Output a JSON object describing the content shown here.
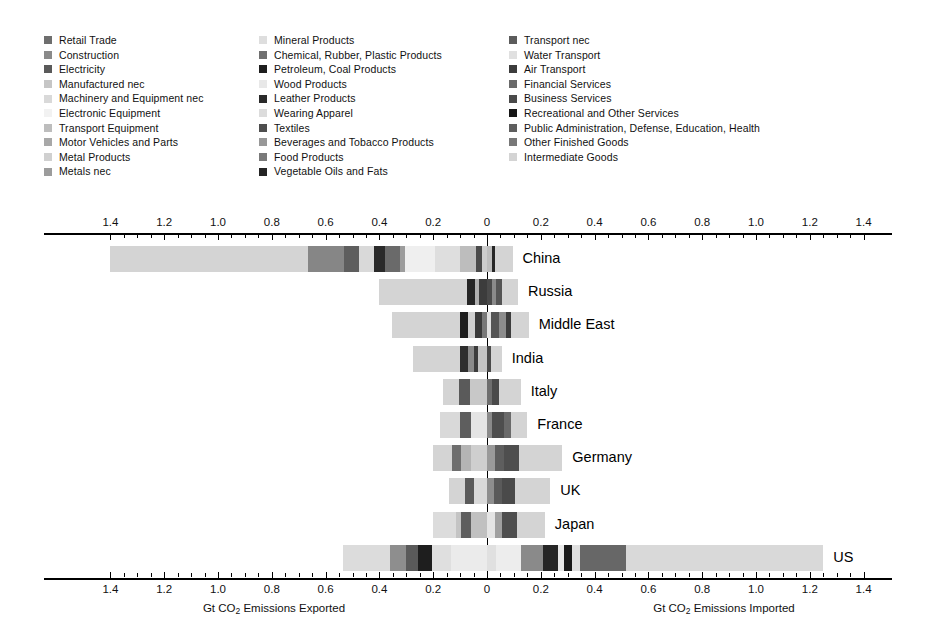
{
  "chart_data": {
    "type": "bar",
    "orientation": "horizontal-diverging-stacked",
    "title": "",
    "xlabel_left": "Gt CO2 Emissions Exported",
    "xlabel_right": "Gt CO2 Emissions Imported",
    "ylabel": "",
    "axis": {
      "left_max": 1.4,
      "right_max": 1.4,
      "center": 0,
      "major_ticks_left": [
        1.4,
        1.2,
        1.0,
        0.8,
        0.6,
        0.4,
        0.2,
        0
      ],
      "major_ticks_right": [
        0.2,
        0.4,
        0.6,
        0.8,
        1.0,
        1.2,
        1.4
      ],
      "minor_tick_step": 0.05,
      "tick_labels_left": [
        "1.4",
        "1.2",
        "1.0",
        "0.8",
        "0.6",
        "0.4",
        "0.2",
        "0"
      ],
      "tick_labels_right": [
        "0.2",
        "0.4",
        "0.6",
        "0.8",
        "1.0",
        "1.2",
        "1.4"
      ],
      "grid": false,
      "axis_top": true,
      "axis_bottom": true
    },
    "legend": {
      "position": "top",
      "columns": 3,
      "entries": [
        {
          "label": "Retail Trade",
          "color": "#6e6e6e"
        },
        {
          "label": "Construction",
          "color": "#8a8a8a"
        },
        {
          "label": "Electricity",
          "color": "#5a5a5a"
        },
        {
          "label": "Manufactured nec",
          "color": "#c6c6c6"
        },
        {
          "label": "Machinery and Equipment nec",
          "color": "#d9d9d9"
        },
        {
          "label": "Electronic Equipment",
          "color": "#f2f2f2"
        },
        {
          "label": "Transport Equipment",
          "color": "#bdbdbd"
        },
        {
          "label": "Motor Vehicles and Parts",
          "color": "#a8a8a8"
        },
        {
          "label": "Metal Products",
          "color": "#d0d0d0"
        },
        {
          "label": "Metals nec",
          "color": "#9c9c9c"
        },
        {
          "label": "Mineral Products",
          "color": "#dedede"
        },
        {
          "label": "Chemical, Rubber, Plastic Products",
          "color": "#707070"
        },
        {
          "label": "Petroleum, Coal Products",
          "color": "#1e1e1e"
        },
        {
          "label": "Wood Products",
          "color": "#e8e8e8"
        },
        {
          "label": "Leather Products",
          "color": "#2a2a2a"
        },
        {
          "label": "Wearing Apparel",
          "color": "#dcdcdc"
        },
        {
          "label": "Textiles",
          "color": "#4e4e4e"
        },
        {
          "label": "Beverages and Tobacco Products",
          "color": "#989898"
        },
        {
          "label": "Food Products",
          "color": "#7a7a7a"
        },
        {
          "label": "Vegetable Oils and Fats",
          "color": "#242424"
        },
        {
          "label": "Transport nec",
          "color": "#5c5c5c"
        },
        {
          "label": "Water Transport",
          "color": "#e0e0e0"
        },
        {
          "label": "Air Transport",
          "color": "#3c3c3c"
        },
        {
          "label": "Financial Services",
          "color": "#6a6a6a"
        },
        {
          "label": "Business Services",
          "color": "#4a4a4a"
        },
        {
          "label": "Recreational and Other Services",
          "color": "#161616"
        },
        {
          "label": "Public Administration, Defense, Education, Health",
          "color": "#5e5e5e"
        },
        {
          "label": "Other Finished Goods",
          "color": "#787878"
        },
        {
          "label": "Intermediate Goods",
          "color": "#d4d4d4"
        }
      ]
    },
    "categories": [
      "China",
      "Russia",
      "Middle East",
      "India",
      "Italy",
      "France",
      "Germany",
      "UK",
      "Japan",
      "US"
    ],
    "totals": {
      "exported": [
        1.4,
        0.4,
        0.355,
        0.275,
        0.165,
        0.175,
        0.2,
        0.14,
        0.2,
        0.535
      ],
      "imported": [
        0.095,
        0.115,
        0.155,
        0.055,
        0.125,
        0.15,
        0.28,
        0.235,
        0.215,
        1.25
      ]
    },
    "rows": [
      {
        "country": "China",
        "exported_segments": [
          {
            "name": "Intermediate Goods",
            "value": 0.735,
            "color": "#d4d4d4"
          },
          {
            "name": "Other Finished Goods",
            "value": 0.135,
            "color": "#868686"
          },
          {
            "name": "Public Administration, Defense, Education, Health",
            "value": 0.055,
            "color": "#5e5e5e"
          },
          {
            "name": "Business Services",
            "value": 0.055,
            "color": "#d9d9d9"
          },
          {
            "name": "Recreational and Other Services",
            "value": 0.04,
            "color": "#2a2a2a"
          },
          {
            "name": "Financial Services",
            "value": 0.055,
            "color": "#6a6a6a"
          },
          {
            "name": "Air Transport",
            "value": 0.02,
            "color": "#9c9c9c"
          },
          {
            "name": "Water Transport",
            "value": 0.11,
            "color": "#efefef"
          },
          {
            "name": "Transport nec",
            "value": 0.095,
            "color": "#dedede"
          },
          {
            "name": "Metals nec",
            "value": 0.06,
            "color": "#bdbdbd"
          },
          {
            "name": "Metal Products",
            "value": 0.02,
            "color": "#4a4a4a"
          },
          {
            "name": "Motor Vehicles and Parts",
            "value": 0.02,
            "color": "#cccccc"
          }
        ],
        "imported_segments": [
          {
            "name": "Intermediate Goods",
            "value": 0.02,
            "color": "#bdbdbd"
          },
          {
            "name": "Other Finished Goods",
            "value": 0.01,
            "color": "#262626"
          },
          {
            "name": "Transport nec",
            "value": 0.065,
            "color": "#d4d4d4"
          }
        ]
      },
      {
        "country": "Russia",
        "exported_segments": [
          {
            "name": "Intermediate Goods",
            "value": 0.325,
            "color": "#d4d4d4"
          },
          {
            "name": "Petroleum, Coal Products",
            "value": 0.03,
            "color": "#262626"
          },
          {
            "name": "Metals nec",
            "value": 0.015,
            "color": "#b0b0b0"
          },
          {
            "name": "Chemical, Rubber, Plastic Products",
            "value": 0.03,
            "color": "#3c3c3c"
          }
        ],
        "imported_segments": [
          {
            "name": "Business Services",
            "value": 0.02,
            "color": "#4a4a4a"
          },
          {
            "name": "Transport nec",
            "value": 0.015,
            "color": "#8a8a8a"
          },
          {
            "name": "Financial Services",
            "value": 0.02,
            "color": "#555555"
          },
          {
            "name": "Intermediate Goods",
            "value": 0.06,
            "color": "#d4d4d4"
          }
        ]
      },
      {
        "country": "Middle East",
        "exported_segments": [
          {
            "name": "Intermediate Goods",
            "value": 0.255,
            "color": "#d4d4d4"
          },
          {
            "name": "Petroleum, Coal Products",
            "value": 0.03,
            "color": "#1e1e1e"
          },
          {
            "name": "Chemical, Rubber, Plastic Products",
            "value": 0.025,
            "color": "#d0d0d0"
          },
          {
            "name": "Metals nec",
            "value": 0.025,
            "color": "#3a3a3a"
          },
          {
            "name": "Other Finished Goods",
            "value": 0.02,
            "color": "#787878"
          }
        ],
        "imported_segments": [
          {
            "name": "Water Transport",
            "value": 0.015,
            "color": "#e0e0e0"
          },
          {
            "name": "Business Services",
            "value": 0.03,
            "color": "#555555"
          },
          {
            "name": "Transport nec",
            "value": 0.025,
            "color": "#8c8c8c"
          },
          {
            "name": "Financial Services",
            "value": 0.02,
            "color": "#3c3c3c"
          },
          {
            "name": "Intermediate Goods",
            "value": 0.065,
            "color": "#d4d4d4"
          }
        ]
      },
      {
        "country": "India",
        "exported_segments": [
          {
            "name": "Intermediate Goods",
            "value": 0.175,
            "color": "#d4d4d4"
          },
          {
            "name": "Recreational and Other Services",
            "value": 0.03,
            "color": "#2e2e2e"
          },
          {
            "name": "Business Services",
            "value": 0.02,
            "color": "#8a8a8a"
          },
          {
            "name": "Financial Services",
            "value": 0.015,
            "color": "#3c3c3c"
          },
          {
            "name": "Other Finished Goods",
            "value": 0.035,
            "color": "#c4c4c4"
          }
        ],
        "imported_segments": [
          {
            "name": "Business Services",
            "value": 0.015,
            "color": "#4a4a4a"
          },
          {
            "name": "Intermediate Goods",
            "value": 0.04,
            "color": "#d4d4d4"
          }
        ]
      },
      {
        "country": "Italy",
        "exported_segments": [
          {
            "name": "Intermediate Goods",
            "value": 0.06,
            "color": "#d4d4d4"
          },
          {
            "name": "Chemical, Rubber, Plastic Products",
            "value": 0.04,
            "color": "#5a5a5a"
          },
          {
            "name": "Other Finished Goods",
            "value": 0.065,
            "color": "#c8c8c8"
          }
        ],
        "imported_segments": [
          {
            "name": "Business Services",
            "value": 0.02,
            "color": "#6e6e6e"
          },
          {
            "name": "Financial Services",
            "value": 0.025,
            "color": "#4a4a4a"
          },
          {
            "name": "Intermediate Goods",
            "value": 0.08,
            "color": "#d4d4d4"
          }
        ]
      },
      {
        "country": "France",
        "exported_segments": [
          {
            "name": "Intermediate Goods",
            "value": 0.075,
            "color": "#d9d9d9"
          },
          {
            "name": "Chemical, Rubber, Plastic Products",
            "value": 0.04,
            "color": "#5e5e5e"
          },
          {
            "name": "Other Finished Goods",
            "value": 0.06,
            "color": "#e4e4e4"
          }
        ],
        "imported_segments": [
          {
            "name": "Transport nec",
            "value": 0.02,
            "color": "#8a8a8a"
          },
          {
            "name": "Business Services",
            "value": 0.045,
            "color": "#4e4e4e"
          },
          {
            "name": "Financial Services",
            "value": 0.025,
            "color": "#6a6a6a"
          },
          {
            "name": "Intermediate Goods",
            "value": 0.06,
            "color": "#d4d4d4"
          }
        ]
      },
      {
        "country": "Germany",
        "exported_segments": [
          {
            "name": "Intermediate Goods",
            "value": 0.07,
            "color": "#d4d4d4"
          },
          {
            "name": "Chemical, Rubber, Plastic Products",
            "value": 0.035,
            "color": "#6e6e6e"
          },
          {
            "name": "Motor Vehicles and Parts",
            "value": 0.035,
            "color": "#b4b4b4"
          },
          {
            "name": "Other Finished Goods",
            "value": 0.06,
            "color": "#cfcfcf"
          }
        ],
        "imported_segments": [
          {
            "name": "Transport nec",
            "value": 0.03,
            "color": "#9a9a9a"
          },
          {
            "name": "Financial Services",
            "value": 0.035,
            "color": "#5e5e5e"
          },
          {
            "name": "Business Services",
            "value": 0.055,
            "color": "#4e4e4e"
          },
          {
            "name": "Intermediate Goods",
            "value": 0.16,
            "color": "#d4d4d4"
          }
        ]
      },
      {
        "country": "UK",
        "exported_segments": [
          {
            "name": "Intermediate Goods",
            "value": 0.06,
            "color": "#d4d4d4"
          },
          {
            "name": "Chemical, Rubber, Plastic Products",
            "value": 0.03,
            "color": "#5a5a5a"
          },
          {
            "name": "Other Finished Goods",
            "value": 0.05,
            "color": "#d9d9d9"
          }
        ],
        "imported_segments": [
          {
            "name": "Transport nec",
            "value": 0.025,
            "color": "#8e8e8e"
          },
          {
            "name": "Financial Services",
            "value": 0.03,
            "color": "#5a5a5a"
          },
          {
            "name": "Business Services",
            "value": 0.05,
            "color": "#4a4a4a"
          },
          {
            "name": "Intermediate Goods",
            "value": 0.13,
            "color": "#d4d4d4"
          }
        ]
      },
      {
        "country": "Japan",
        "exported_segments": [
          {
            "name": "Intermediate Goods",
            "value": 0.085,
            "color": "#dcdcdc"
          },
          {
            "name": "Metals nec",
            "value": 0.02,
            "color": "#c4c4c4"
          },
          {
            "name": "Chemical, Rubber, Plastic Products",
            "value": 0.035,
            "color": "#5e5e5e"
          },
          {
            "name": "Other Finished Goods",
            "value": 0.06,
            "color": "#c0c0c0"
          }
        ],
        "imported_segments": [
          {
            "name": "Water Transport",
            "value": 0.03,
            "color": "#e4e4e4"
          },
          {
            "name": "Transport nec",
            "value": 0.025,
            "color": "#a0a0a0"
          },
          {
            "name": "Business Services",
            "value": 0.055,
            "color": "#4e4e4e"
          },
          {
            "name": "Intermediate Goods",
            "value": 0.105,
            "color": "#d4d4d4"
          }
        ]
      },
      {
        "country": "US",
        "exported_segments": [
          {
            "name": "Intermediate Goods",
            "value": 0.175,
            "color": "#dcdcdc"
          },
          {
            "name": "Other Finished Goods",
            "value": 0.06,
            "color": "#8e8e8e"
          },
          {
            "name": "Chemical, Rubber, Plastic Products",
            "value": 0.045,
            "color": "#5a5a5a"
          },
          {
            "name": "Petroleum, Coal Products",
            "value": 0.05,
            "color": "#1e1e1e"
          },
          {
            "name": "Wearing Apparel",
            "value": 0.07,
            "color": "#dfdfdf"
          },
          {
            "name": "Machinery and Equipment nec",
            "value": 0.135,
            "color": "#ebebeb"
          }
        ],
        "imported_segments": [
          {
            "name": "Wood Products",
            "value": 0.035,
            "color": "#e0e0e0"
          },
          {
            "name": "Mineral Products",
            "value": 0.09,
            "color": "#ededed"
          },
          {
            "name": "Transport nec",
            "value": 0.085,
            "color": "#8a8a8a"
          },
          {
            "name": "Recreational and Other Services",
            "value": 0.055,
            "color": "#262626"
          },
          {
            "name": "Air Transport",
            "value": 0.02,
            "color": "#e8e8e8"
          },
          {
            "name": "Financial Services",
            "value": 0.03,
            "color": "#1a1a1a"
          },
          {
            "name": "Business Services",
            "value": 0.03,
            "color": "#e0e0e0"
          },
          {
            "name": "Public Administration, Defense, Education, Health",
            "value": 0.17,
            "color": "#676767"
          },
          {
            "name": "Intermediate Goods",
            "value": 0.735,
            "color": "#d9d9d9"
          }
        ]
      }
    ]
  }
}
